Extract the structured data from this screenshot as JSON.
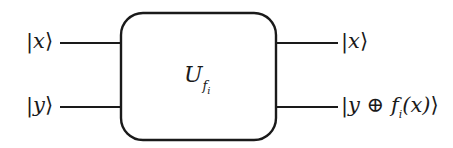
{
  "diagram": {
    "type": "quantum-oracle-circuit",
    "gate": {
      "symbol": "U",
      "subscript": "f",
      "sub_subscript": "i"
    },
    "inputs": [
      {
        "bar": "|",
        "var": "x",
        "close": "⟩"
      },
      {
        "bar": "|",
        "var": "y",
        "close": "⟩"
      }
    ],
    "outputs": [
      {
        "bar": "|",
        "var": "x",
        "close": "⟩"
      },
      {
        "bar": "|",
        "pre": "y ⊕ ",
        "func": "f",
        "func_sub": "i",
        "arg": "(x)",
        "close": "⟩"
      }
    ],
    "colors": {
      "stroke": "#1a1a1a",
      "background": "#ffffff"
    }
  }
}
